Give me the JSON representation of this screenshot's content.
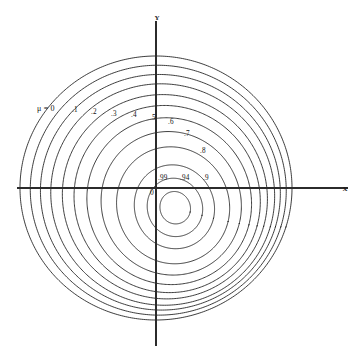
{
  "figure": {
    "kind": "phase-plane-limit-cycle-family",
    "background_color": "#ffffff",
    "curve_color": "#1a1a1a",
    "axis_color": "#2b2b2b",
    "axes": {
      "x_label": "X",
      "y_label": "Y",
      "origin_label": "0",
      "origin_px": {
        "x": 156,
        "y": 188
      },
      "x_axis": {
        "x1": 17,
        "x2": 348,
        "y": 188
      },
      "y_axis": {
        "x": 156,
        "y1": 21,
        "y2": 346
      }
    },
    "parameter_symbol": "μ",
    "legend_prefix": "μ =",
    "labels": [
      {
        "text": "μ = 0",
        "value": "0",
        "x": 37,
        "y": 104
      },
      {
        "text": ".1",
        "value": ".1",
        "x": 72,
        "y": 106
      },
      {
        "text": ".2",
        "value": ".2",
        "x": 91,
        "y": 108
      },
      {
        "text": ".3",
        "value": ".3",
        "x": 111,
        "y": 110
      },
      {
        "text": ".4",
        "value": ".4",
        "x": 131,
        "y": 111
      },
      {
        "text": ".5",
        "value": ".5",
        "x": 150,
        "y": 114
      },
      {
        "text": ".6",
        "value": ".6",
        "x": 168,
        "y": 118
      },
      {
        "text": ".7",
        "value": ".7",
        "x": 184,
        "y": 130
      },
      {
        "text": ".8",
        "value": ".8",
        "x": 200,
        "y": 147
      },
      {
        "text": ".9",
        "value": ".9",
        "x": 203,
        "y": 174
      },
      {
        "text": ".94",
        "value": ".94",
        "x": 180,
        "y": 174
      },
      {
        "text": ".99",
        "value": ".99",
        "x": 158,
        "y": 174
      }
    ]
  },
  "chart_data": {
    "type": "line",
    "title": "",
    "xlabel": "X",
    "ylabel": "Y",
    "grid": false,
    "legend_position": "inline-curve-labels",
    "parameter_name": "mu",
    "parameter_values": [
      0,
      0.1,
      0.2,
      0.3,
      0.4,
      0.5,
      0.6,
      0.7,
      0.8,
      0.9,
      0.94,
      0.99
    ],
    "series": [
      {
        "name": "mu = 0",
        "mu": 0,
        "scale": 1.0,
        "skew": 0.0
      },
      {
        "name": "mu = .1",
        "mu": 0.1,
        "scale": 0.94,
        "skew": 0.05
      },
      {
        "name": "mu = .2",
        "mu": 0.2,
        "scale": 0.88,
        "skew": 0.1
      },
      {
        "name": "mu = .3",
        "mu": 0.3,
        "scale": 0.82,
        "skew": 0.16
      },
      {
        "name": "mu = .4",
        "mu": 0.4,
        "scale": 0.75,
        "skew": 0.22
      },
      {
        "name": "mu = .5",
        "mu": 0.5,
        "scale": 0.68,
        "skew": 0.29
      },
      {
        "name": "mu = .6",
        "mu": 0.6,
        "scale": 0.6,
        "skew": 0.36
      },
      {
        "name": "mu = .7",
        "mu": 0.7,
        "scale": 0.51,
        "skew": 0.44
      },
      {
        "name": "mu = .8",
        "mu": 0.8,
        "scale": 0.41,
        "skew": 0.53
      },
      {
        "name": "mu = .9",
        "mu": 0.9,
        "scale": 0.29,
        "skew": 0.62
      },
      {
        "name": "mu = .94",
        "mu": 0.94,
        "scale": 0.2,
        "skew": 0.68
      },
      {
        "name": "mu = .99",
        "mu": 0.99,
        "scale": 0.11,
        "skew": 0.74
      }
    ],
    "xlim": [
      -1.2,
      1.35
    ],
    "ylim": [
      -1.25,
      1.15
    ]
  }
}
